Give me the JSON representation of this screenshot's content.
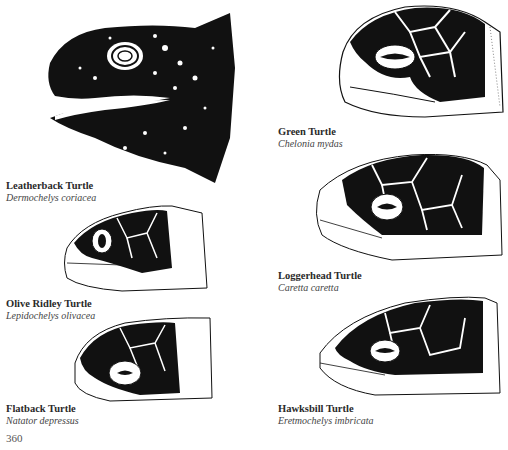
{
  "page": {
    "page_number": "360",
    "background": "#ffffff",
    "ink_color": "#111111"
  },
  "turtles": [
    {
      "common_name": "Leatherback Turtle",
      "scientific_name": "Dermochelys coriacea"
    },
    {
      "common_name": "Green Turtle",
      "scientific_name": "Chelonia mydas"
    },
    {
      "common_name": "Olive Ridley Turtle",
      "scientific_name": "Lepidochelys olivacea"
    },
    {
      "common_name": "Loggerhead Turtle",
      "scientific_name": "Caretta caretta"
    },
    {
      "common_name": "Flatback Turtle",
      "scientific_name": "Natator depressus"
    },
    {
      "common_name": "Hawksbill Turtle",
      "scientific_name": "Eretmochelys imbricata"
    }
  ]
}
